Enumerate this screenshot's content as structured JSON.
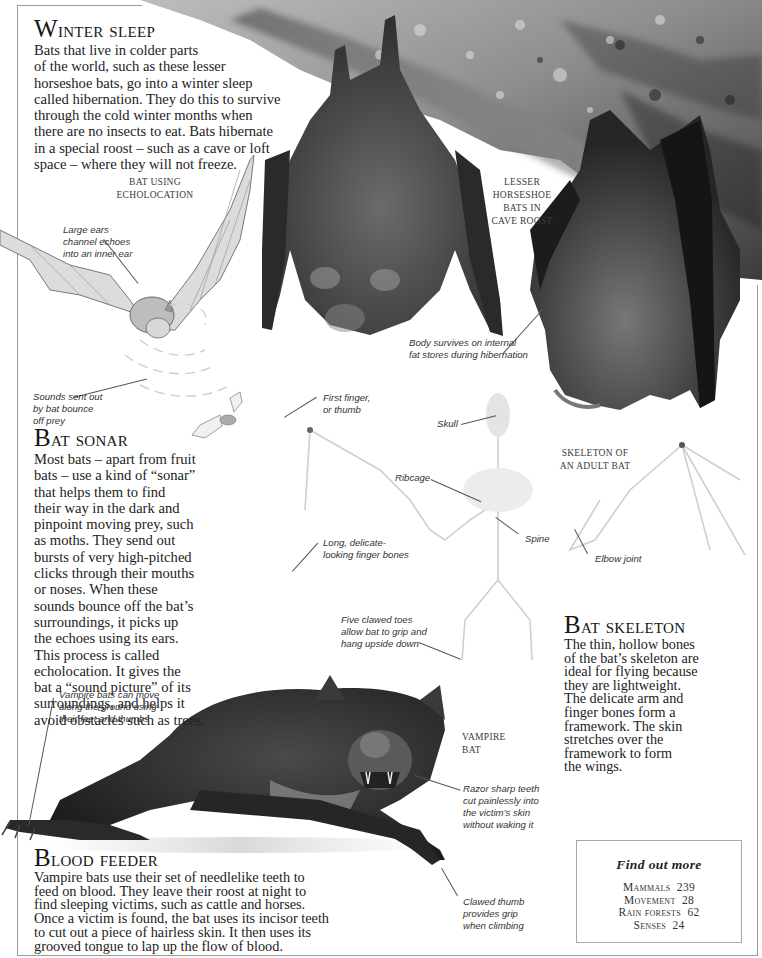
{
  "sections": {
    "winter_sleep": {
      "heading_cap": "W",
      "heading_rest": "inter sleep",
      "lines": [
        "Bats that live in colder parts",
        "of the world, such as these lesser",
        "horseshoe bats, go into a winter sleep",
        "called hibernation. They do this to survive",
        "through the cold winter months when",
        "there are no insects to eat. Bats hibernate",
        "in a special roost – such as a cave or loft",
        "space – where they will not freeze."
      ]
    },
    "bat_sonar": {
      "heading_cap": "B",
      "heading_rest": "at sonar",
      "lines": [
        "Most bats – apart from fruit",
        "bats – use a kind of “sonar”",
        "that helps them to find",
        "their way in the dark and",
        "pinpoint moving prey, such",
        "as moths. They send out",
        "bursts of very high-pitched",
        "clicks through their mouths",
        "or noses. When these",
        "sounds bounce off the bat’s",
        "surroundings, it picks up",
        "the echoes using its ears.",
        "This process is called",
        "echolocation. It gives the",
        "bat a “sound picture” of its",
        "surroundings, and helps it",
        "avoid obstacles such as trees."
      ]
    },
    "bat_skeleton": {
      "heading_cap": "B",
      "heading_rest": "at skeleton",
      "lines": [
        "The thin, hollow bones",
        "of the bat’s skeleton are",
        "ideal for flying because",
        "they are lightweight.",
        "The delicate arm and",
        "finger bones form a",
        "framework. The skin",
        "stretches over the",
        "framework to form",
        "the wings."
      ]
    },
    "blood_feeder": {
      "heading_cap": "B",
      "heading_rest": "lood feeder",
      "lines": [
        "Vampire bats use their set of needlelike teeth to",
        "feed on blood. They leave their roost at night to",
        "find sleeping victims, such as cattle and horses.",
        "Once a victim is found, the bat uses its incisor teeth",
        "to cut out a piece of hairless skin. It then uses its",
        "grooved tongue to lap up the flow of blood."
      ]
    }
  },
  "captions": {
    "echolocation": [
      "Bat using",
      "echolocation"
    ],
    "horseshoe": [
      "Lesser",
      "horseshoe",
      "bats in",
      "cave roost"
    ],
    "skeleton": [
      "Skeleton of",
      "an adult bat"
    ],
    "vampire": [
      "Vampire",
      "bat"
    ]
  },
  "labels": {
    "large_ears": [
      "Large ears",
      "channel echoes",
      "into an inner ear"
    ],
    "sounds_sent": [
      "Sounds sent out",
      "by bat bounce",
      "off prey"
    ],
    "body_survives": [
      "Body survives on internal",
      "fat stores during hibernation"
    ],
    "first_finger": [
      "First finger,",
      "or thumb"
    ],
    "skull": [
      "Skull"
    ],
    "ribcage": [
      "Ribcage"
    ],
    "spine": [
      "Spine"
    ],
    "elbow": [
      "Elbow joint"
    ],
    "finger_bones": [
      "Long, delicate-",
      "looking finger bones"
    ],
    "five_toes": [
      "Five clawed toes",
      "allow bat to grip and",
      "hang upside down"
    ],
    "vampire_move": [
      "Vampire bats can move",
      "along the ground using",
      "their feet and thumbs"
    ],
    "razor_teeth": [
      "Razor sharp teeth",
      "cut painlessly into",
      "the victim’s skin",
      "without waking it"
    ],
    "clawed_thumb": [
      "Clawed thumb",
      "provides grip",
      "when climbing"
    ]
  },
  "find_out_more": {
    "title": "Find out more",
    "items": [
      {
        "topic": "Mammals",
        "page": "239"
      },
      {
        "topic": "Movement",
        "page": "28"
      },
      {
        "topic": "Rain forests",
        "page": "62"
      },
      {
        "topic": "Senses",
        "page": "24"
      }
    ]
  },
  "colors": {
    "text": "#1e1e1e",
    "frame": "#9a9a9a",
    "rock_light": "#c9c9c9",
    "rock_dark": "#3a3a3a",
    "fur": "#4a4a4a"
  }
}
